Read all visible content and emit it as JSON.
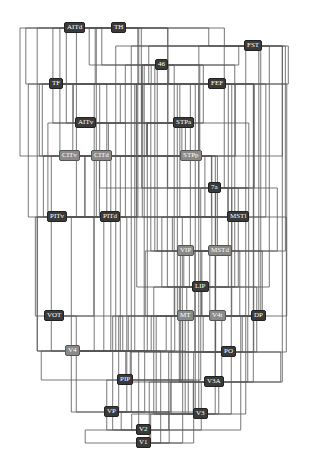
{
  "diagram": {
    "type": "hierarchical-connectivity",
    "edge_color": "#555555",
    "node_dark_color": "#3a3a3a",
    "node_mid_color": "#8a8a8a",
    "nodes": [
      {
        "id": "AITd",
        "label": "AITd",
        "x": 64,
        "y": 22,
        "style": "dark"
      },
      {
        "id": "TH",
        "label": "TH",
        "x": 111,
        "y": 22,
        "style": "dark"
      },
      {
        "id": "FST",
        "label": "FST",
        "x": 244,
        "y": 40,
        "style": "dark"
      },
      {
        "id": "46",
        "label": "46",
        "x": 155,
        "y": 59,
        "style": "dark"
      },
      {
        "id": "TF",
        "label": "TF",
        "x": 49,
        "y": 78,
        "style": "dark"
      },
      {
        "id": "FEF",
        "label": "FEF",
        "x": 208,
        "y": 78,
        "style": "dark"
      },
      {
        "id": "AITv",
        "label": "AITv",
        "x": 75,
        "y": 117,
        "style": "dark"
      },
      {
        "id": "STPa",
        "label": "STPa",
        "x": 173,
        "y": 117,
        "style": "dark"
      },
      {
        "id": "CITv",
        "label": "CITv",
        "x": 59,
        "y": 150,
        "style": "mid"
      },
      {
        "id": "CITd",
        "label": "CITd",
        "x": 91,
        "y": 150,
        "style": "mid"
      },
      {
        "id": "STPp",
        "label": "STPp",
        "x": 180,
        "y": 150,
        "style": "mid"
      },
      {
        "id": "7a",
        "label": "7a",
        "x": 208,
        "y": 182,
        "style": "dark"
      },
      {
        "id": "PITv",
        "label": "PITv",
        "x": 47,
        "y": 211,
        "style": "dark"
      },
      {
        "id": "PITd",
        "label": "PITd",
        "x": 100,
        "y": 211,
        "style": "dark"
      },
      {
        "id": "MSTl",
        "label": "MSTl",
        "x": 227,
        "y": 211,
        "style": "dark"
      },
      {
        "id": "VIP",
        "label": "VIP",
        "x": 177,
        "y": 245,
        "style": "mid"
      },
      {
        "id": "MSTd",
        "label": "MSTd",
        "x": 208,
        "y": 245,
        "style": "mid"
      },
      {
        "id": "LIP",
        "label": "LIP",
        "x": 192,
        "y": 281,
        "style": "dark"
      },
      {
        "id": "VOT",
        "label": "VOT",
        "x": 44,
        "y": 310,
        "style": "dark"
      },
      {
        "id": "MT",
        "label": "MT",
        "x": 177,
        "y": 310,
        "style": "mid"
      },
      {
        "id": "V4t",
        "label": "V4t",
        "x": 209,
        "y": 310,
        "style": "mid"
      },
      {
        "id": "DP",
        "label": "DP",
        "x": 251,
        "y": 310,
        "style": "dark"
      },
      {
        "id": "V4",
        "label": "V4",
        "x": 65,
        "y": 345,
        "style": "mid"
      },
      {
        "id": "PO",
        "label": "PO",
        "x": 221,
        "y": 346,
        "style": "dark"
      },
      {
        "id": "PIP",
        "label": "PIP",
        "x": 117,
        "y": 374,
        "style": "dark"
      },
      {
        "id": "V3A",
        "label": "V3A",
        "x": 204,
        "y": 376,
        "style": "dark"
      },
      {
        "id": "VP",
        "label": "VP",
        "x": 104,
        "y": 406,
        "style": "dark"
      },
      {
        "id": "V3",
        "label": "V3",
        "x": 193,
        "y": 408,
        "style": "dark"
      },
      {
        "id": "V2",
        "label": "V2",
        "x": 136,
        "y": 424,
        "style": "dark"
      },
      {
        "id": "V1",
        "label": "V1",
        "x": 136,
        "y": 437,
        "style": "dark"
      }
    ],
    "edges": [
      [
        "V1",
        "V2"
      ],
      [
        "V1",
        "V3"
      ],
      [
        "V1",
        "MT"
      ],
      [
        "V1",
        "V4"
      ],
      [
        "V1",
        "V3A"
      ],
      [
        "V1",
        "PO"
      ],
      [
        "V1",
        "VP"
      ],
      [
        "V2",
        "V3"
      ],
      [
        "V2",
        "VP"
      ],
      [
        "V2",
        "V4"
      ],
      [
        "V2",
        "MT"
      ],
      [
        "V2",
        "PO"
      ],
      [
        "V2",
        "V3A"
      ],
      [
        "V2",
        "V4t"
      ],
      [
        "V2",
        "PIP"
      ],
      [
        "V3",
        "V3A"
      ],
      [
        "V3",
        "V4"
      ],
      [
        "V3",
        "MT"
      ],
      [
        "V3",
        "PO"
      ],
      [
        "V3",
        "VIP"
      ],
      [
        "V3",
        "LIP"
      ],
      [
        "V3",
        "FEF"
      ],
      [
        "V3",
        "PIP"
      ],
      [
        "V3",
        "DP"
      ],
      [
        "V3",
        "V4t"
      ],
      [
        "V3",
        "FST"
      ],
      [
        "VP",
        "V4"
      ],
      [
        "VP",
        "MT"
      ],
      [
        "VP",
        "V3A"
      ],
      [
        "VP",
        "PITv"
      ],
      [
        "VP",
        "PITd"
      ],
      [
        "VP",
        "VOT"
      ],
      [
        "VP",
        "FEF"
      ],
      [
        "VP",
        "FST"
      ],
      [
        "V3A",
        "V4"
      ],
      [
        "V3A",
        "MT"
      ],
      [
        "V3A",
        "PO"
      ],
      [
        "V3A",
        "LIP"
      ],
      [
        "V3A",
        "DP"
      ],
      [
        "V3A",
        "FST"
      ],
      [
        "V3A",
        "MSTd"
      ],
      [
        "V3A",
        "7a"
      ],
      [
        "V3A",
        "FEF"
      ],
      [
        "PIP",
        "PO"
      ],
      [
        "PIP",
        "DP"
      ],
      [
        "PIP",
        "7a"
      ],
      [
        "PIP",
        "V4"
      ],
      [
        "PO",
        "MT"
      ],
      [
        "PO",
        "V4t"
      ],
      [
        "PO",
        "MSTl"
      ],
      [
        "PO",
        "MSTd"
      ],
      [
        "PO",
        "VIP"
      ],
      [
        "PO",
        "LIP"
      ],
      [
        "PO",
        "DP"
      ],
      [
        "PO",
        "7a"
      ],
      [
        "PO",
        "FEF"
      ],
      [
        "PO",
        "46"
      ],
      [
        "V4",
        "V4t"
      ],
      [
        "V4",
        "MT"
      ],
      [
        "V4",
        "VOT"
      ],
      [
        "V4",
        "PITv"
      ],
      [
        "V4",
        "PITd"
      ],
      [
        "V4",
        "CITv"
      ],
      [
        "V4",
        "CITd"
      ],
      [
        "V4",
        "DP"
      ],
      [
        "V4",
        "LIP"
      ],
      [
        "V4",
        "FST"
      ],
      [
        "V4",
        "FEF"
      ],
      [
        "V4",
        "TF"
      ],
      [
        "V4",
        "TH"
      ],
      [
        "V4",
        "STPp"
      ],
      [
        "V4",
        "STPa"
      ],
      [
        "MT",
        "V4t"
      ],
      [
        "MT",
        "MSTl"
      ],
      [
        "MT",
        "MSTd"
      ],
      [
        "MT",
        "FST"
      ],
      [
        "MT",
        "VIP"
      ],
      [
        "MT",
        "LIP"
      ],
      [
        "MT",
        "FEF"
      ],
      [
        "V4t",
        "MSTl"
      ],
      [
        "V4t",
        "MSTd"
      ],
      [
        "V4t",
        "FST"
      ],
      [
        "V4t",
        "VIP"
      ],
      [
        "DP",
        "LIP"
      ],
      [
        "DP",
        "7a"
      ],
      [
        "DP",
        "FEF"
      ],
      [
        "DP",
        "46"
      ],
      [
        "DP",
        "MSTd"
      ],
      [
        "VOT",
        "PITv"
      ],
      [
        "VOT",
        "PITd"
      ],
      [
        "LIP",
        "VIP"
      ],
      [
        "LIP",
        "7a"
      ],
      [
        "LIP",
        "MSTl"
      ],
      [
        "LIP",
        "MSTd"
      ],
      [
        "LIP",
        "FEF"
      ],
      [
        "LIP",
        "46"
      ],
      [
        "LIP",
        "STPp"
      ],
      [
        "LIP",
        "TF"
      ],
      [
        "LIP",
        "FST"
      ],
      [
        "VIP",
        "MSTl"
      ],
      [
        "VIP",
        "MSTd"
      ],
      [
        "VIP",
        "7a"
      ],
      [
        "VIP",
        "FEF"
      ],
      [
        "VIP",
        "46"
      ],
      [
        "VIP",
        "STPp"
      ],
      [
        "MSTd",
        "7a"
      ],
      [
        "MSTd",
        "FEF"
      ],
      [
        "MSTd",
        "STPp"
      ],
      [
        "MSTd",
        "FST"
      ],
      [
        "MSTd",
        "46"
      ],
      [
        "MSTl",
        "7a"
      ],
      [
        "MSTl",
        "FEF"
      ],
      [
        "MSTl",
        "FST"
      ],
      [
        "MSTl",
        "STPp"
      ],
      [
        "MSTl",
        "TF"
      ],
      [
        "MSTl",
        "46"
      ],
      [
        "PITv",
        "CITv"
      ],
      [
        "PITv",
        "CITd"
      ],
      [
        "PITv",
        "AITv"
      ],
      [
        "PITv",
        "TF"
      ],
      [
        "PITv",
        "TH"
      ],
      [
        "PITv",
        "FEF"
      ],
      [
        "PITv",
        "STPp"
      ],
      [
        "PITd",
        "CITv"
      ],
      [
        "PITd",
        "CITd"
      ],
      [
        "PITd",
        "AITv"
      ],
      [
        "PITd",
        "AITd"
      ],
      [
        "PITd",
        "TF"
      ],
      [
        "PITd",
        "STPp"
      ],
      [
        "PITd",
        "FEF"
      ],
      [
        "7a",
        "STPp"
      ],
      [
        "7a",
        "STPa"
      ],
      [
        "7a",
        "TF"
      ],
      [
        "7a",
        "TH"
      ],
      [
        "7a",
        "FEF"
      ],
      [
        "7a",
        "46"
      ],
      [
        "7a",
        "FST"
      ],
      [
        "CITv",
        "AITv"
      ],
      [
        "CITv",
        "AITd"
      ],
      [
        "CITv",
        "TF"
      ],
      [
        "CITv",
        "STPa"
      ],
      [
        "CITd",
        "AITv"
      ],
      [
        "CITd",
        "AITd"
      ],
      [
        "CITd",
        "STPp"
      ],
      [
        "CITd",
        "STPa"
      ],
      [
        "CITd",
        "TF"
      ],
      [
        "STPp",
        "STPa"
      ],
      [
        "STPp",
        "FEF"
      ],
      [
        "STPp",
        "TF"
      ],
      [
        "STPp",
        "TH"
      ],
      [
        "STPp",
        "46"
      ],
      [
        "STPp",
        "FST"
      ],
      [
        "AITv",
        "AITd"
      ],
      [
        "AITv",
        "STPa"
      ],
      [
        "AITv",
        "TF"
      ],
      [
        "AITv",
        "TH"
      ],
      [
        "AITv",
        "46"
      ],
      [
        "STPa",
        "AITd"
      ],
      [
        "STPa",
        "TF"
      ],
      [
        "STPa",
        "TH"
      ],
      [
        "STPa",
        "46"
      ],
      [
        "STPa",
        "FEF"
      ],
      [
        "FEF",
        "46"
      ],
      [
        "FEF",
        "TF"
      ],
      [
        "FEF",
        "FST"
      ],
      [
        "FEF",
        "TH"
      ],
      [
        "TF",
        "TH"
      ],
      [
        "TF",
        "46"
      ],
      [
        "TF",
        "AITd"
      ],
      [
        "TF",
        "FST"
      ],
      [
        "46",
        "FST"
      ],
      [
        "46",
        "TH"
      ],
      [
        "46",
        "AITd"
      ],
      [
        "FST",
        "TH"
      ],
      [
        "FST",
        "AITd"
      ],
      [
        "AITd",
        "TH"
      ]
    ]
  }
}
